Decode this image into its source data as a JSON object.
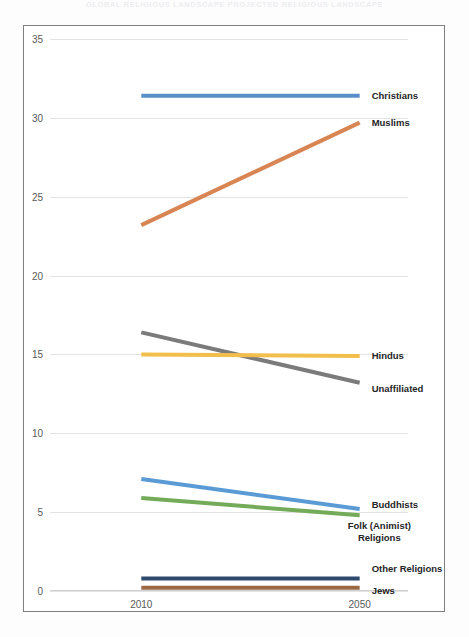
{
  "scan_header": "GLOBAL RELIGIOUS LANDSCAPE    PROJECTED RELIGIOUS LANDSCAPE",
  "chart_data": {
    "type": "line",
    "title": "",
    "subtitle": "",
    "xlabel": "",
    "ylabel": "",
    "x": [
      "2010",
      "2050"
    ],
    "categories": [
      "2010",
      "2050"
    ],
    "ylim": [
      0,
      35
    ],
    "ytick_labels": [
      "0",
      "5",
      "10",
      "15",
      "20",
      "25",
      "30",
      "35"
    ],
    "ytick_values": [
      0,
      5,
      10,
      15,
      20,
      25,
      30,
      35
    ],
    "grid": true,
    "legend_position": "right-inline-labels",
    "series": [
      {
        "name": "Christians",
        "values": [
          31.4,
          31.4
        ],
        "color": "#5b8fc9",
        "label_lines": [
          "Christians"
        ]
      },
      {
        "name": "Muslims",
        "values": [
          23.2,
          29.7
        ],
        "color": "#d98553",
        "label_lines": [
          "Muslims"
        ]
      },
      {
        "name": "Unaffiliated",
        "values": [
          16.4,
          13.2
        ],
        "color": "#7b7b7b",
        "label_lines": [
          "Unaffiliated"
        ]
      },
      {
        "name": "Hindus",
        "values": [
          15.0,
          14.9
        ],
        "color": "#f2be4c",
        "label_lines": [
          "Hindus"
        ]
      },
      {
        "name": "Buddhists",
        "values": [
          7.1,
          5.2
        ],
        "color": "#5b9bd5",
        "label_lines": [
          "Buddhists"
        ]
      },
      {
        "name": "Folk (Animist) Religions",
        "values": [
          5.9,
          4.8
        ],
        "color": "#73ab58",
        "label_lines": [
          "Folk (Animist)",
          "Religions"
        ]
      },
      {
        "name": "Other Religions",
        "values": [
          0.8,
          0.8
        ],
        "color": "#2e4b6e",
        "label_lines": [
          "Other Religions"
        ]
      },
      {
        "name": "Jews",
        "values": [
          0.2,
          0.2
        ],
        "color": "#9b6a45",
        "label_lines": [
          "Jews"
        ]
      }
    ]
  }
}
